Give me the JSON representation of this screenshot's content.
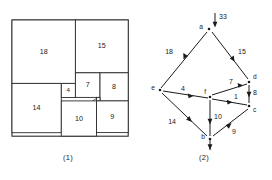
{
  "figure": {
    "panels": [
      {
        "id": "squared-square",
        "caption": "(1)",
        "type": "squared-square-dissection",
        "outer_side_label": "33",
        "squares": [
          {
            "name": "18",
            "label": "18",
            "x": 0,
            "y": 0,
            "size": 18
          },
          {
            "name": "15",
            "label": "15",
            "x": 18,
            "y": 0,
            "size": 15
          },
          {
            "name": "14",
            "label": "14",
            "x": 0,
            "y": 18,
            "size": 14
          },
          {
            "name": "4",
            "label": "4",
            "x": 14,
            "y": 14,
            "size": 4
          },
          {
            "name": "7",
            "label": "7",
            "x": 18,
            "y": 15,
            "size": 7
          },
          {
            "name": "8",
            "label": "8",
            "x": 25,
            "y": 15,
            "size": 8
          },
          {
            "name": "1",
            "label": "1",
            "x": 17,
            "y": 18,
            "size": 1
          },
          {
            "name": "10",
            "label": "10",
            "x": 14,
            "y": 19,
            "size": 10
          },
          {
            "name": "9",
            "label": "9",
            "x": 24,
            "y": 23,
            "size": 9
          }
        ]
      },
      {
        "id": "flow-network",
        "caption": "(2)",
        "type": "directed-graph",
        "source_flow_label": "33",
        "sink_flow_shown": true,
        "nodes": [
          {
            "id": "a",
            "label": "a",
            "x": 209,
            "y": 29
          },
          {
            "id": "e",
            "label": "e",
            "x": 160,
            "y": 90
          },
          {
            "id": "d",
            "label": "d",
            "x": 249,
            "y": 82
          },
          {
            "id": "f",
            "label": "f",
            "x": 210,
            "y": 97
          },
          {
            "id": "c",
            "label": "c",
            "x": 249,
            "y": 106
          },
          {
            "id": "b",
            "label": "b",
            "x": 210,
            "y": 139
          }
        ],
        "edges": [
          {
            "from": "a",
            "to": "e",
            "label": "18"
          },
          {
            "from": "a",
            "to": "d",
            "label": "15"
          },
          {
            "from": "e",
            "to": "f",
            "label": "4"
          },
          {
            "from": "e",
            "to": "b",
            "label": "14"
          },
          {
            "from": "f",
            "to": "d",
            "label": "7"
          },
          {
            "from": "f",
            "to": "c",
            "label": "1"
          },
          {
            "from": "d",
            "to": "c",
            "label": "8"
          },
          {
            "from": "f",
            "to": "b",
            "label": "10"
          },
          {
            "from": "b",
            "to": "c",
            "label": "9"
          }
        ]
      }
    ]
  }
}
